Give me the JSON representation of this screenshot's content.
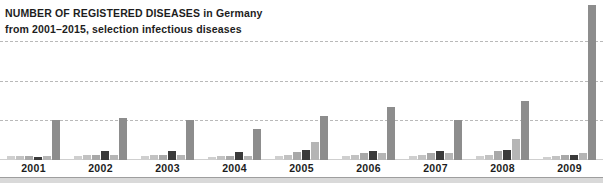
{
  "title": {
    "line1_strong": "NUMBER OF REGISTERED DISEASES",
    "line1_rest": " in Germany",
    "line2": "from 2001–2015, selection infectious diseases"
  },
  "colors": {
    "background": "#ffffff",
    "gridline": "#b9b9b9",
    "baseline": "#cfcfcf",
    "text": "#1d1d1d",
    "bottom_strip": "#d9d9d9",
    "series": [
      "#cfcfcf",
      "#c2c2c2",
      "#a8a8a8",
      "#3a3a3a",
      "#b5b5b5",
      "#8d8d8d"
    ]
  },
  "chart_data": {
    "type": "bar",
    "title": "NUMBER OF REGISTERED DISEASES in Germany",
    "subtitle": "from 2001–2015, selection infectious diseases",
    "xlabel": "",
    "ylabel": "",
    "grid": true,
    "legend_position": "none",
    "ylim": [
      0,
      120
    ],
    "gridline_values": [
      30,
      60,
      90
    ],
    "categories": [
      "2001",
      "2002",
      "2003",
      "2004",
      "2005",
      "2006",
      "2007",
      "2008",
      "2009"
    ],
    "series": [
      {
        "name": "series-1",
        "color": "#cfcfcf",
        "values": [
          3,
          3,
          3,
          2,
          3,
          3,
          3,
          3,
          2
        ]
      },
      {
        "name": "series-2",
        "color": "#c2c2c2",
        "values": [
          3,
          4,
          4,
          3,
          4,
          4,
          4,
          4,
          3
        ]
      },
      {
        "name": "series-3",
        "color": "#a8a8a8",
        "values": [
          3,
          4,
          4,
          3,
          6,
          5,
          5,
          7,
          4
        ]
      },
      {
        "name": "series-4",
        "color": "#3a3a3a",
        "values": [
          2,
          7,
          7,
          6,
          8,
          7,
          7,
          8,
          4
        ]
      },
      {
        "name": "series-5",
        "color": "#b5b5b5",
        "values": [
          3,
          4,
          4,
          3,
          14,
          5,
          5,
          16,
          5
        ]
      },
      {
        "name": "series-6",
        "color": "#8d8d8d",
        "values": [
          31,
          32,
          31,
          24,
          34,
          41,
          31,
          45,
          119
        ]
      }
    ]
  }
}
